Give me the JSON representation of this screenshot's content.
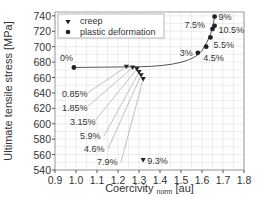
{
  "chart_data": {
    "type": "scatter",
    "title": "",
    "xlabel": "Coercivity norm [au]",
    "xlabel_main": "Coercivity",
    "xlabel_sub": "norm",
    "xlabel_unit": "[au]",
    "ylabel": "Ultimate tensile stress [MPa]",
    "xlim": [
      0.9,
      1.8
    ],
    "ylim": [
      540,
      745
    ],
    "xticks": [
      "0.9",
      "1.0",
      "1.1",
      "1.2",
      "1.3",
      "1.4",
      "1.5",
      "1.6",
      "1.7",
      "1.8"
    ],
    "yticks": [
      "540",
      "560",
      "580",
      "600",
      "620",
      "640",
      "660",
      "680",
      "700",
      "720",
      "740"
    ],
    "grid": true,
    "legend": {
      "position": "upper left",
      "entries": [
        "creep",
        "plastic deformation"
      ]
    },
    "series": [
      {
        "name": "creep",
        "marker": "triangle-down",
        "points": [
          {
            "label": "0.85%",
            "x": 1.24,
            "y": 674
          },
          {
            "label": "1.85%",
            "x": 1.27,
            "y": 673
          },
          {
            "label": "3.15%",
            "x": 1.29,
            "y": 671
          },
          {
            "label": "5.9%",
            "x": 1.3,
            "y": 667
          },
          {
            "label": "4.6%",
            "x": 1.31,
            "y": 663
          },
          {
            "label": "7.9%",
            "x": 1.32,
            "y": 658
          },
          {
            "label": "9.3%",
            "x": 1.32,
            "y": 553
          }
        ]
      },
      {
        "name": "plastic deformation",
        "marker": "circle",
        "points": [
          {
            "label": "0%",
            "x": 0.99,
            "y": 673
          },
          {
            "label": "3%",
            "x": 1.58,
            "y": 692
          },
          {
            "label": "4.5%",
            "x": 1.62,
            "y": 700
          },
          {
            "label": "5.5%",
            "x": 1.64,
            "y": 712
          },
          {
            "label": "7.5%",
            "x": 1.65,
            "y": 723
          },
          {
            "label": "10.5%",
            "x": 1.66,
            "y": 727
          },
          {
            "label": "9%",
            "x": 1.66,
            "y": 739
          }
        ]
      }
    ]
  }
}
